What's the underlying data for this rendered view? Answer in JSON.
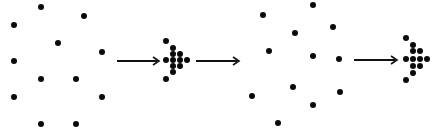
{
  "diagram": {
    "colors": {
      "dot": "#0a0a0a",
      "arrow": "#111111",
      "background": "#ffffff"
    },
    "dot_radius": 3,
    "cluster_dot_radius": 3,
    "stages": [
      {
        "name": "scattered-group-1",
        "dots": [
          [
            41,
            7
          ],
          [
            84,
            16
          ],
          [
            14,
            25
          ],
          [
            58,
            43
          ],
          [
            102,
            52
          ],
          [
            14,
            61
          ],
          [
            41,
            79
          ],
          [
            76,
            79
          ],
          [
            14,
            97
          ],
          [
            102,
            97
          ],
          [
            41,
            124
          ],
          [
            76,
            124
          ]
        ]
      },
      {
        "name": "arrow-1",
        "from": [
          117,
          61
        ],
        "to": [
          159,
          61
        ]
      },
      {
        "name": "cluster-1",
        "dots": [
          [
            166,
            41
          ],
          [
            173,
            48
          ],
          [
            173,
            54
          ],
          [
            180,
            54
          ],
          [
            166,
            60
          ],
          [
            173,
            60
          ],
          [
            180,
            60
          ],
          [
            187,
            60
          ],
          [
            173,
            66
          ],
          [
            180,
            66
          ],
          [
            173,
            72
          ],
          [
            166,
            79
          ]
        ]
      },
      {
        "name": "arrow-2",
        "from": [
          196,
          61
        ],
        "to": [
          239,
          61
        ]
      },
      {
        "name": "scattered-group-2",
        "dots": [
          [
            313,
            5
          ],
          [
            263,
            15
          ],
          [
            295,
            33
          ],
          [
            333,
            27
          ],
          [
            269,
            51
          ],
          [
            313,
            56
          ],
          [
            339,
            59
          ],
          [
            293,
            87
          ],
          [
            252,
            96
          ],
          [
            340,
            92
          ],
          [
            313,
            105
          ],
          [
            278,
            123
          ]
        ]
      },
      {
        "name": "arrow-3",
        "from": [
          354,
          60
        ],
        "to": [
          397,
          60
        ]
      },
      {
        "name": "cluster-2",
        "dots": [
          [
            406,
            38
          ],
          [
            413,
            45
          ],
          [
            413,
            51
          ],
          [
            420,
            51
          ],
          [
            406,
            59
          ],
          [
            413,
            59
          ],
          [
            420,
            59
          ],
          [
            427,
            59
          ],
          [
            413,
            66
          ],
          [
            420,
            66
          ],
          [
            413,
            73
          ],
          [
            406,
            80
          ]
        ]
      }
    ]
  }
}
